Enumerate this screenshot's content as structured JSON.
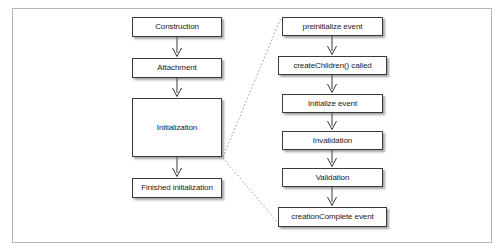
{
  "figure": {
    "frame": {
      "border_color": "#b6b6b6",
      "background": "#ffffff"
    }
  },
  "diagram": {
    "type": "flowchart",
    "box_style": {
      "fill": "#ffffff",
      "border_color": "#3a3a3a",
      "shadow_color": "#5a5a5a",
      "text_color": "#1a1a1a"
    },
    "connector_style": {
      "line_color": "#3a3a3a",
      "arrow_shape": "open-v",
      "guide_style": "dotted",
      "guide_color": "#9a9a9a"
    },
    "columns": [
      {
        "name": "lifecycle-phases",
        "nodes": [
          {
            "id": "construction",
            "label": "Construction",
            "x": 132,
            "y": 17,
            "w": 90,
            "h": 20
          },
          {
            "id": "attachment",
            "label": "Attachment",
            "x": 132,
            "y": 58,
            "w": 90,
            "h": 20
          },
          {
            "id": "initialization",
            "label": "Initialization",
            "x": 132,
            "y": 98,
            "w": 90,
            "h": 59
          },
          {
            "id": "finished-initialization",
            "label": "Finished initialization",
            "x": 132,
            "y": 178,
            "w": 90,
            "h": 20
          }
        ]
      },
      {
        "name": "initialization-detail",
        "nodes": [
          {
            "id": "preinitialize-event",
            "label": "preinitialize event",
            "x": 282,
            "y": 17,
            "w": 101,
            "h": 19
          },
          {
            "id": "create-children-called",
            "label": "createChildren() called",
            "x": 278,
            "y": 56,
            "w": 109,
            "h": 19
          },
          {
            "id": "initialize-event",
            "label": "Initialize event",
            "x": 282,
            "y": 94,
            "w": 101,
            "h": 19
          },
          {
            "id": "invalidation",
            "label": "Invalidation",
            "x": 282,
            "y": 131,
            "w": 101,
            "h": 19
          },
          {
            "id": "validation",
            "label": "Validation",
            "x": 282,
            "y": 168,
            "w": 101,
            "h": 19
          },
          {
            "id": "creation-complete-event",
            "label": "creationComplete event",
            "x": 278,
            "y": 207,
            "w": 109,
            "h": 20
          }
        ]
      }
    ],
    "arrows": [
      {
        "from": "construction",
        "to": "attachment"
      },
      {
        "from": "attachment",
        "to": "initialization"
      },
      {
        "from": "initialization",
        "to": "finished-initialization"
      },
      {
        "from": "preinitialize-event",
        "to": "create-children-called"
      },
      {
        "from": "create-children-called",
        "to": "initialize-event"
      },
      {
        "from": "initialize-event",
        "to": "invalidation"
      },
      {
        "from": "invalidation",
        "to": "validation"
      },
      {
        "from": "validation",
        "to": "creation-complete-event"
      }
    ],
    "guides": [
      {
        "from": "initialization-top-right",
        "to": "preinitialize-event-left"
      },
      {
        "from": "initialization-bottom-right",
        "to": "creation-complete-event-left"
      }
    ]
  }
}
